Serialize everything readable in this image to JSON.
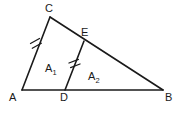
{
  "figure": {
    "type": "geometry-diagram",
    "background_color": "#ffffff",
    "stroke_color": "#1a1a1a",
    "points": {
      "A": {
        "label": "A",
        "x": 22,
        "y": 90,
        "label_x": 9,
        "label_y": 101
      },
      "B": {
        "label": "B",
        "x": 163,
        "y": 90,
        "label_x": 165,
        "label_y": 101
      },
      "C": {
        "label": "C",
        "x": 50,
        "y": 17,
        "label_x": 45,
        "label_y": 12
      },
      "D": {
        "label": "D",
        "x": 65,
        "y": 90,
        "label_x": 60,
        "label_y": 101
      },
      "E": {
        "label": "E",
        "x": 84,
        "y": 41,
        "label_x": 81,
        "label_y": 36
      }
    },
    "segments": [
      {
        "name": "AB",
        "from": "A",
        "to": "B"
      },
      {
        "name": "AC",
        "from": "A",
        "to": "C",
        "tick_marks": 2
      },
      {
        "name": "CB",
        "from": "C",
        "to": "B"
      },
      {
        "name": "DE",
        "from": "D",
        "to": "E",
        "tick_marks": 2
      }
    ],
    "tick_groups": [
      {
        "name": "tick-mark-ac",
        "on_segment": "AC",
        "count": 2,
        "center_x": 36,
        "center_y": 40
      },
      {
        "name": "tick-mark-de",
        "on_segment": "DE",
        "count": 2,
        "center_x": 74,
        "center_y": 63
      }
    ],
    "regions": [
      {
        "name": "region-a1",
        "label_base": "A",
        "label_subscript": "1",
        "label_text": "A₁",
        "x": 46,
        "y": 72
      },
      {
        "name": "region-a2",
        "label_base": "A",
        "label_subscript": "2",
        "label_text": "A₂",
        "x": 89,
        "y": 80
      }
    ]
  }
}
